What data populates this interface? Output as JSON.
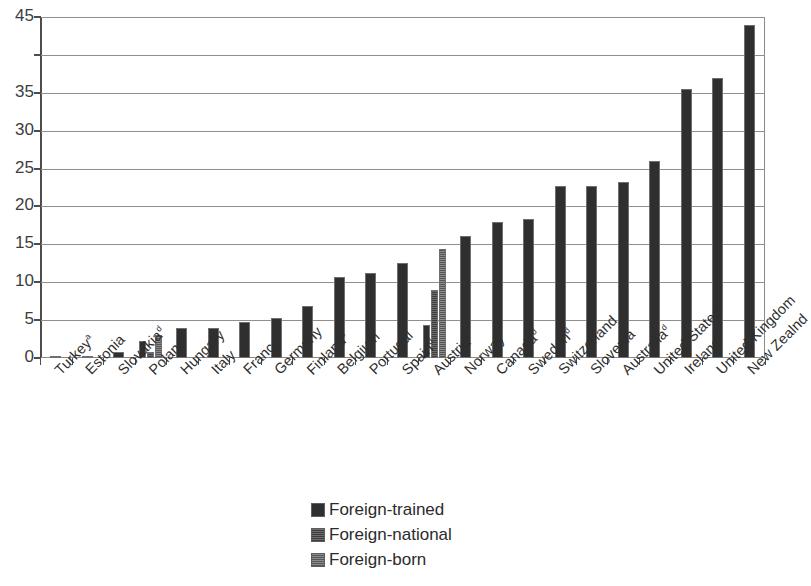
{
  "chart_data": {
    "type": "bar",
    "title": "",
    "subtitle": "",
    "xlabel": "",
    "ylabel": "",
    "ylim": [
      0,
      45
    ],
    "yticks": [
      0,
      5,
      10,
      15,
      20,
      25,
      30,
      35,
      40,
      45
    ],
    "ytick_labels": [
      "0",
      "5",
      "10",
      "15",
      "20",
      "25",
      "30",
      "35",
      "",
      "45"
    ],
    "grid": "horizontal",
    "legend_position": "bottom-center",
    "legend": [
      "Foreign-trained",
      "Foreign-national",
      "Foreign-born"
    ],
    "categories": [
      "Turkey",
      "Estonia",
      "Slovakia",
      "Poland",
      "Hungary",
      "Italy",
      "France",
      "Germany",
      "Finland",
      "Belgium",
      "Portugal",
      "Spain",
      "Austria",
      "Norway",
      "Canada",
      "Sweden",
      "Switzerland",
      "Slovenia",
      "Australia",
      "United States",
      "Ireland",
      "United Kingdom",
      "New Zealnd"
    ],
    "category_footnotes": [
      "a",
      "",
      "d",
      "b",
      "",
      "",
      "",
      "",
      "c",
      "",
      "",
      "d",
      "e",
      "",
      "d",
      "d",
      "",
      "",
      "d",
      "d",
      "",
      "",
      ""
    ],
    "series": [
      {
        "name": "Foreign-trained",
        "values": [
          0.1,
          0.3,
          0.8,
          2.2,
          3.9,
          3.9,
          4.7,
          5.3,
          6.9,
          10.7,
          11.2,
          12.6,
          4.3,
          16.1,
          18.0,
          18.4,
          22.7,
          22.7,
          23.2,
          26.0,
          35.5,
          37.0,
          44.0
        ]
      },
      {
        "name": "Foreign-national",
        "values": [
          null,
          null,
          null,
          0.8,
          null,
          null,
          null,
          null,
          null,
          null,
          null,
          null,
          9.0,
          null,
          null,
          null,
          null,
          null,
          null,
          null,
          null,
          null,
          null
        ]
      },
      {
        "name": "Foreign-born",
        "values": [
          null,
          null,
          null,
          3.0,
          null,
          null,
          null,
          null,
          null,
          null,
          null,
          null,
          14.4,
          null,
          null,
          null,
          null,
          null,
          null,
          null,
          null,
          null,
          null
        ]
      }
    ]
  },
  "colors": {
    "foreign_trained": "#2f2f2f",
    "foreign_national": "#4a4a4a",
    "foreign_born": "#666666",
    "axis": "#4d4d4d",
    "grid": "#8f8f8f",
    "background": "#ffffff"
  }
}
